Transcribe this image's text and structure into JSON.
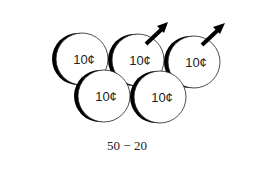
{
  "diagram": {
    "coins": [
      {
        "id": "top-left",
        "label": "10¢",
        "cx": 82,
        "cy": 59,
        "removed": false
      },
      {
        "id": "top-middle",
        "label": "10¢",
        "cx": 138,
        "cy": 60,
        "removed": true
      },
      {
        "id": "top-right",
        "label": "10¢",
        "cx": 194,
        "cy": 62,
        "removed": true
      },
      {
        "id": "bottom-left",
        "label": "10¢",
        "cx": 104,
        "cy": 96,
        "removed": false
      },
      {
        "id": "bottom-middle",
        "label": "10¢",
        "cx": 160,
        "cy": 97,
        "removed": false
      }
    ],
    "arrows": [
      {
        "from": "top-middle",
        "direction": "up-right"
      },
      {
        "from": "top-right",
        "direction": "up-right"
      }
    ],
    "caption": "50 − 20",
    "colors": {
      "coin_fill": "#ffffff",
      "coin_stroke": "#222222",
      "shadow": "#000000",
      "arrow": "#000000"
    }
  }
}
